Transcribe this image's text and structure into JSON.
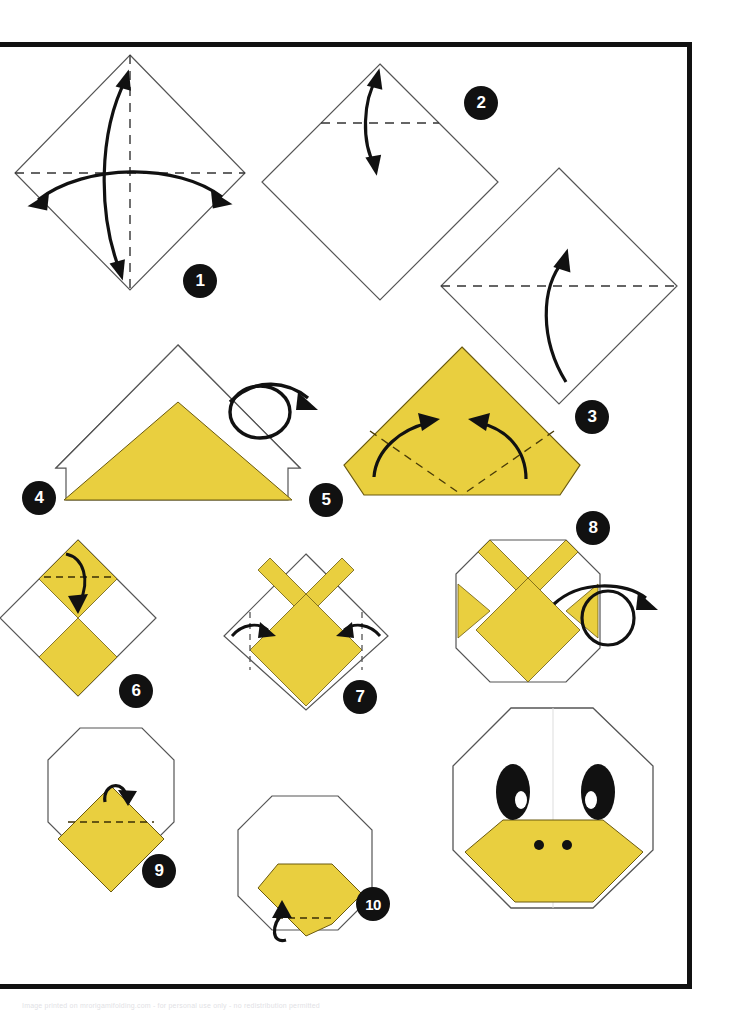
{
  "page": {
    "background_color": "#ffffff",
    "frame_color": "#111111",
    "paper_front_color": "#E9CF3F",
    "paper_back_color": "#ffffff",
    "line_color": "#555555",
    "arrow_color": "#111111",
    "footer_note": "Image printed on mrorigamifolding.com - for personal use only - no redistribution permitted"
  },
  "legend": {
    "valley_fold": "dashed line",
    "fold_arrow": "solid curved arrow",
    "turn_over": "looped arrow"
  },
  "steps": [
    {
      "number": "1",
      "label": "square-diamond-crease-both-diagonals",
      "shape": "diamond",
      "fill": "#ffffff",
      "fold_lines": [
        "vertical-dashed-center",
        "horizontal-dashed-center"
      ],
      "arrows": [
        "double-headed-vertical-curve",
        "double-headed-horizontal-curve"
      ],
      "badge_number": "1"
    },
    {
      "number": "2",
      "label": "fold-top-corner-to-center",
      "shape": "diamond",
      "fill": "#ffffff",
      "fold_lines": [
        "horizontal-dashed-upper"
      ],
      "arrows": [
        "double-headed-vertical-curve"
      ],
      "badge_number": "2"
    },
    {
      "number": "3",
      "label": "fold-bottom-half-up",
      "shape": "diamond",
      "fill": "#ffffff",
      "fold_lines": [
        "horizontal-dashed-center"
      ],
      "arrows": [
        "single-up-curve"
      ],
      "badge_number": "3"
    },
    {
      "number": "4",
      "label": "turn-model-over",
      "shape": "triangle-with-white-border-triangle",
      "fill": "#E9CF3F",
      "fold_lines": [],
      "arrows": [
        "turn-over-loop"
      ],
      "badge_number": "4"
    },
    {
      "number": "5",
      "label": "fold-two-lower-corners-up",
      "shape": "yellow-pentagon",
      "fill": "#E9CF3F",
      "fold_lines": [
        "dashed-left-diagonal",
        "dashed-right-diagonal"
      ],
      "arrows": [
        "curve-left-inward",
        "curve-right-inward"
      ],
      "badge_number": "5"
    },
    {
      "number": "6",
      "label": "fold-top-point-down",
      "shape": "checkered-diamond",
      "fill": "#E9CF3F",
      "fold_lines": [
        "horizontal-dashed-upper"
      ],
      "arrows": [
        "single-down-curve"
      ],
      "badge_number": "6"
    },
    {
      "number": "7",
      "label": "fold-side-corners-inward",
      "shape": "diamond-with-v",
      "fill": "#E9CF3F",
      "fold_lines": [
        "vertical-dashed-left",
        "vertical-dashed-right"
      ],
      "arrows": [
        "curve-left-in",
        "curve-right-in"
      ],
      "badge_number": "7"
    },
    {
      "number": "8",
      "label": "turn-model-over-again",
      "shape": "octagon-with-v-and-side-triangles",
      "fill": "#E9CF3F",
      "fold_lines": [],
      "arrows": [
        "turn-over-loop"
      ],
      "badge_number": "8"
    },
    {
      "number": "9",
      "label": "fold-beak-top-edge-back",
      "shape": "octagon-with-yellow-diamond",
      "fill": "#E9CF3F",
      "fold_lines": [
        "horizontal-dashed-upper"
      ],
      "arrows": [
        "small-curl-over"
      ],
      "badge_number": "9"
    },
    {
      "number": "10",
      "label": "fold-beak-bottom-tip-back",
      "shape": "octagon-with-yellow-beak",
      "fill": "#E9CF3F",
      "fold_lines": [
        "horizontal-dashed-lower"
      ],
      "arrows": [
        "small-curl-under"
      ],
      "badge_number": "10"
    }
  ],
  "result": {
    "label": "finished-duck-face",
    "shape": "octagon",
    "face_color": "#ffffff",
    "beak_color": "#E9CF3F",
    "eye_color": "#111111",
    "eye_highlight_color": "#ffffff",
    "nostril_color": "#111111",
    "eye_count": 2,
    "nostril_count": 2
  }
}
